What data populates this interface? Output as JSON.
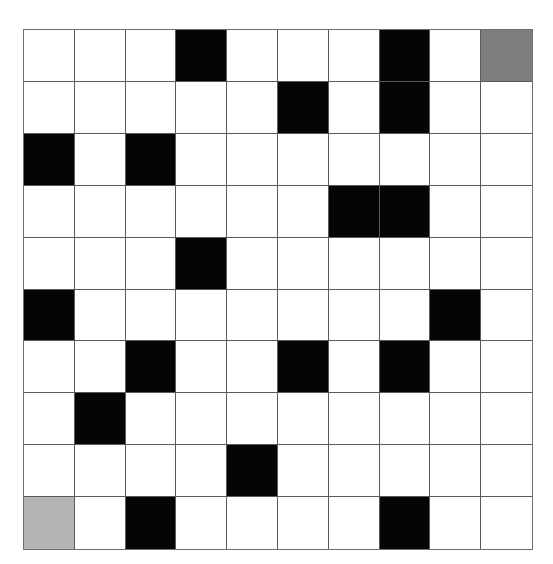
{
  "grid": {
    "rows": 10,
    "cols": 10,
    "legend": {
      "empty": "#ffffff",
      "wall": "#050505",
      "goal": "#7d7d7d",
      "start": "#b4b4b4"
    },
    "cells": [
      [
        "empty",
        "empty",
        "empty",
        "wall",
        "empty",
        "empty",
        "empty",
        "wall",
        "empty",
        "goal"
      ],
      [
        "empty",
        "empty",
        "empty",
        "empty",
        "empty",
        "wall",
        "empty",
        "wall",
        "empty",
        "empty"
      ],
      [
        "wall",
        "empty",
        "wall",
        "empty",
        "empty",
        "empty",
        "empty",
        "empty",
        "empty",
        "empty"
      ],
      [
        "empty",
        "empty",
        "empty",
        "empty",
        "empty",
        "empty",
        "wall",
        "wall",
        "empty",
        "empty"
      ],
      [
        "empty",
        "empty",
        "empty",
        "wall",
        "empty",
        "empty",
        "empty",
        "empty",
        "empty",
        "empty"
      ],
      [
        "wall",
        "empty",
        "empty",
        "empty",
        "empty",
        "empty",
        "empty",
        "empty",
        "wall",
        "empty"
      ],
      [
        "empty",
        "empty",
        "wall",
        "empty",
        "empty",
        "wall",
        "empty",
        "wall",
        "empty",
        "empty"
      ],
      [
        "empty",
        "wall",
        "empty",
        "empty",
        "empty",
        "empty",
        "empty",
        "empty",
        "empty",
        "empty"
      ],
      [
        "empty",
        "empty",
        "empty",
        "empty",
        "wall",
        "empty",
        "empty",
        "empty",
        "empty",
        "empty"
      ],
      [
        "start",
        "empty",
        "wall",
        "empty",
        "empty",
        "empty",
        "empty",
        "wall",
        "empty",
        "empty"
      ]
    ]
  }
}
